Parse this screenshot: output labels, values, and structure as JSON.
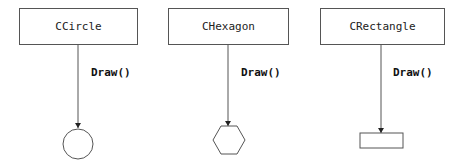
{
  "diagram": {
    "classes": [
      {
        "name": "CCircle",
        "method": "Draw()",
        "shape": "circle"
      },
      {
        "name": "CHexagon",
        "method": "Draw()",
        "shape": "hexagon"
      },
      {
        "name": "CRectangle",
        "method": "Draw()",
        "shape": "rectangle"
      }
    ],
    "colors": {
      "stroke": "#555555",
      "text": "#222222",
      "background": "#ffffff"
    }
  }
}
